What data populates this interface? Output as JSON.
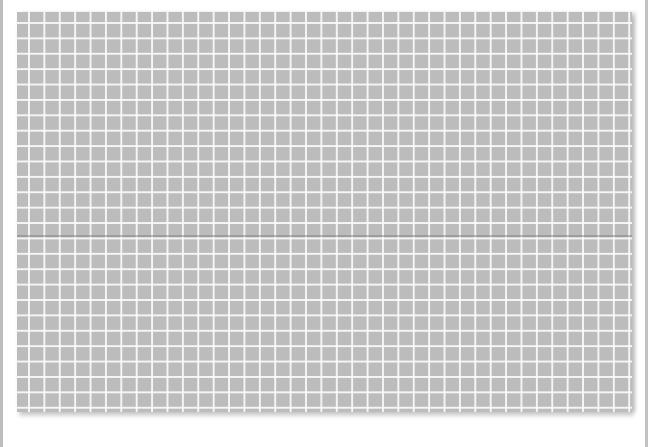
{
  "scene": {
    "description": "Photograph of a sheet of gray graph paper with white grid lines and a horizontal fold crease",
    "colors": {
      "paper": "#bcbcbc",
      "grid_lines": "#ffffff",
      "background": "#ffffff",
      "edge_strips": "#bdbdbd"
    }
  }
}
